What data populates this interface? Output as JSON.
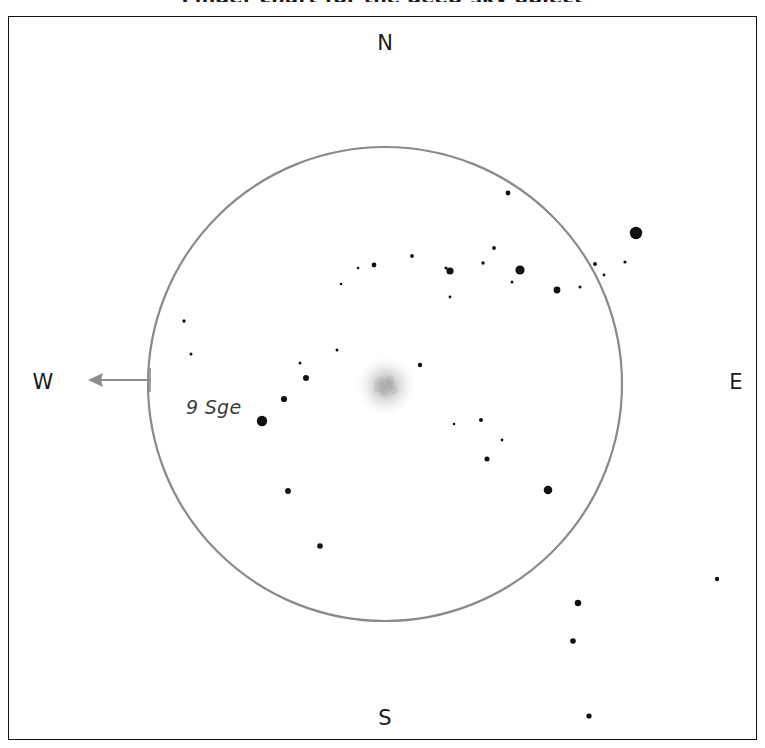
{
  "chart": {
    "title": "Finder chart for the deep-sky object",
    "bottom_caption": "",
    "background_color": "#ffffff",
    "frame_color": "#111111",
    "circle_color": "#8a8a8a",
    "star_color": "#111111",
    "arrow_color": "#8d8d8d",
    "label_color": "#3a3a3a"
  },
  "cardinals": {
    "north": "N",
    "south": "S",
    "west": "W",
    "east": "E"
  },
  "object_label": "9 Sge",
  "chart_data": {
    "type": "scatter",
    "title": "Finder chart for the deep-sky object",
    "xlabel": "",
    "ylabel": "",
    "xlim": [
      8,
      757
    ],
    "ylim": [
      16,
      740
    ],
    "grid": false,
    "legend": null,
    "orientation": {
      "north": "top",
      "south": "bottom",
      "east": "right",
      "west": "left",
      "note": "mirror-reversed field; east at right, west at left"
    },
    "field_circle": {
      "cx": 385,
      "cy": 384,
      "r": 237,
      "stroke": "#8a8a8a",
      "stroke_width": 2.2
    },
    "direction_arrow": {
      "from_x": 150,
      "from_y": 380,
      "to_x": 88,
      "to_y": 380,
      "points": "west",
      "color": "#8d8d8d"
    },
    "nebula": {
      "cx": 386,
      "cy": 386,
      "r": 22,
      "label": "diffuse cluster",
      "color": "#b0b0b0"
    },
    "labeled_star": {
      "name": "9 Sge",
      "x": 262,
      "y": 421,
      "r": 5.2,
      "label_x": 186,
      "label_y": 396
    },
    "stars": [
      {
        "x": 636,
        "y": 233,
        "r": 6.2
      },
      {
        "x": 262,
        "y": 421,
        "r": 5.2
      },
      {
        "x": 520,
        "y": 270,
        "r": 4.6
      },
      {
        "x": 450,
        "y": 271,
        "r": 3.6
      },
      {
        "x": 557,
        "y": 290,
        "r": 3.4
      },
      {
        "x": 548,
        "y": 490,
        "r": 4.3
      },
      {
        "x": 578,
        "y": 603,
        "r": 3.2
      },
      {
        "x": 573,
        "y": 641,
        "r": 2.8
      },
      {
        "x": 284,
        "y": 399,
        "r": 3.1
      },
      {
        "x": 306,
        "y": 378,
        "r": 3.0
      },
      {
        "x": 288,
        "y": 491,
        "r": 2.9
      },
      {
        "x": 320,
        "y": 546,
        "r": 2.8
      },
      {
        "x": 487,
        "y": 459,
        "r": 2.5
      },
      {
        "x": 481,
        "y": 420,
        "r": 2.0
      },
      {
        "x": 508,
        "y": 193,
        "r": 2.4
      },
      {
        "x": 589,
        "y": 716,
        "r": 2.6
      },
      {
        "x": 717,
        "y": 579,
        "r": 2.2
      },
      {
        "x": 420,
        "y": 365,
        "r": 2.2
      },
      {
        "x": 374,
        "y": 265,
        "r": 2.4
      },
      {
        "x": 412,
        "y": 256,
        "r": 1.9
      },
      {
        "x": 446,
        "y": 268,
        "r": 1.6
      },
      {
        "x": 483,
        "y": 263,
        "r": 1.7
      },
      {
        "x": 494,
        "y": 248,
        "r": 1.9
      },
      {
        "x": 595,
        "y": 264,
        "r": 2.0
      },
      {
        "x": 512,
        "y": 282,
        "r": 1.5
      },
      {
        "x": 184,
        "y": 321,
        "r": 1.7
      },
      {
        "x": 191,
        "y": 354,
        "r": 1.5
      },
      {
        "x": 337,
        "y": 350,
        "r": 1.5
      },
      {
        "x": 300,
        "y": 363,
        "r": 1.5
      },
      {
        "x": 450,
        "y": 297,
        "r": 1.4
      },
      {
        "x": 580,
        "y": 287,
        "r": 1.5
      },
      {
        "x": 604,
        "y": 275,
        "r": 1.4
      },
      {
        "x": 625,
        "y": 262,
        "r": 1.6
      },
      {
        "x": 502,
        "y": 440,
        "r": 1.4
      },
      {
        "x": 454,
        "y": 424,
        "r": 1.3
      },
      {
        "x": 341,
        "y": 284,
        "r": 1.3
      },
      {
        "x": 358,
        "y": 268,
        "r": 1.3
      }
    ]
  }
}
